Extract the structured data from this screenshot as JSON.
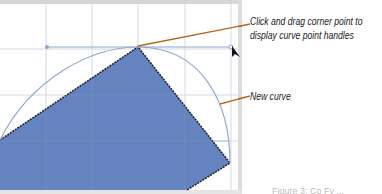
{
  "callouts": {
    "corner_point": {
      "line1": "Click and drag corner point to",
      "line2": "display curve point handles"
    },
    "new_curve": "New curve"
  },
  "figure_caption_partial": "Figure 3: Co Fy ...",
  "colors": {
    "shape_fill": "#6483bf",
    "shape_stroke": "#1c2233",
    "grid": "#d3dbe6",
    "handle_line": "#8ea6d0",
    "curve": "#94a8c8",
    "leader": "#b8641e",
    "frame": "#d4d4d4"
  },
  "icons": [
    "cursor-arrow-icon",
    "handle-point-icon"
  ]
}
